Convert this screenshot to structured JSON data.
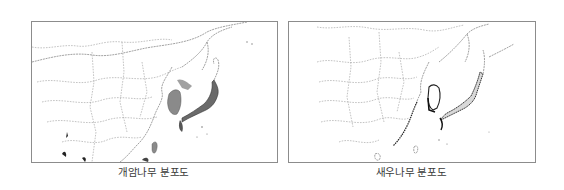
{
  "maps": [
    {
      "id": "left",
      "caption": "개암나무 분포도",
      "distribution_color": "#8a8a8a",
      "highlighted_regions": [
        "Korean Peninsula",
        "Southern Manchuria coast",
        "Japan (Honshu, Kyushu, Shikoku)",
        "Taiwan",
        "Southern China coast"
      ]
    },
    {
      "id": "right",
      "caption": "새우나무 분포도",
      "distribution_color": "#222222",
      "highlighted_regions": [
        "Korean Peninsula (west & south coast)",
        "Japan (Honshu, Kyushu, Shikoku)",
        "Eastern China coast"
      ]
    }
  ],
  "colors": {
    "frame": "#8c8c8c",
    "border_lines": "#9a9a9a",
    "caption_text": "#3a3a3a",
    "background": "#ffffff"
  }
}
